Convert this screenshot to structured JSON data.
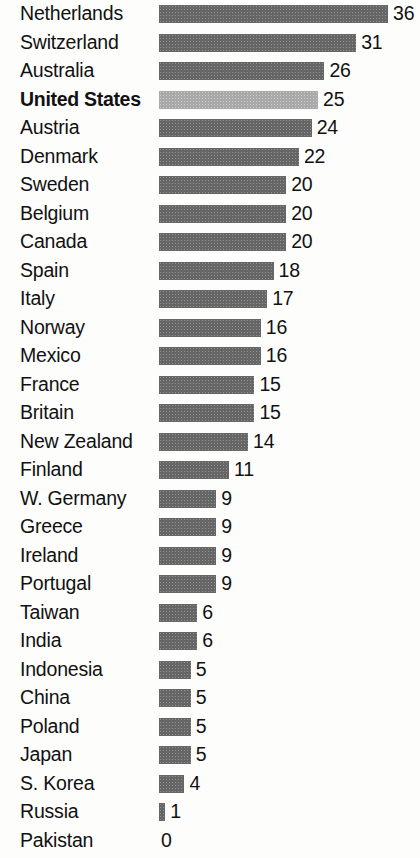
{
  "chart_data": {
    "type": "bar",
    "orientation": "horizontal",
    "title": "",
    "xlabel": "",
    "ylabel": "",
    "xlim": [
      0,
      36
    ],
    "grid": false,
    "legend": "none",
    "highlight_category": "United States",
    "colors": {
      "bar": "#666666",
      "bar_highlight": "#a9a9a9",
      "text": "#111111",
      "background": "#fdfdfc"
    },
    "categories": [
      "Netherlands",
      "Switzerland",
      "Australia",
      "United States",
      "Austria",
      "Denmark",
      "Sweden",
      "Belgium",
      "Canada",
      "Spain",
      "Italy",
      "Norway",
      "Mexico",
      "France",
      "Britain",
      "New Zealand",
      "Finland",
      "W. Germany",
      "Greece",
      "Ireland",
      "Portugal",
      "Taiwan",
      "India",
      "Indonesia",
      "China",
      "Poland",
      "Japan",
      "S. Korea",
      "Russia",
      "Pakistan"
    ],
    "values": [
      36,
      31,
      26,
      25,
      24,
      22,
      20,
      20,
      20,
      18,
      17,
      16,
      16,
      15,
      15,
      14,
      11,
      9,
      9,
      9,
      9,
      6,
      6,
      5,
      5,
      5,
      5,
      4,
      1,
      0
    ],
    "rows": [
      {
        "label": "Netherlands",
        "value": 36,
        "value_text": "36",
        "highlight": false
      },
      {
        "label": "Switzerland",
        "value": 31,
        "value_text": "31",
        "highlight": false
      },
      {
        "label": "Australia",
        "value": 26,
        "value_text": "26",
        "highlight": false
      },
      {
        "label": "United States",
        "value": 25,
        "value_text": "25",
        "highlight": true
      },
      {
        "label": "Austria",
        "value": 24,
        "value_text": "24",
        "highlight": false
      },
      {
        "label": "Denmark",
        "value": 22,
        "value_text": "22",
        "highlight": false
      },
      {
        "label": "Sweden",
        "value": 20,
        "value_text": "20",
        "highlight": false
      },
      {
        "label": "Belgium",
        "value": 20,
        "value_text": "20",
        "highlight": false
      },
      {
        "label": "Canada",
        "value": 20,
        "value_text": "20",
        "highlight": false
      },
      {
        "label": "Spain",
        "value": 18,
        "value_text": "18",
        "highlight": false
      },
      {
        "label": "Italy",
        "value": 17,
        "value_text": "17",
        "highlight": false
      },
      {
        "label": "Norway",
        "value": 16,
        "value_text": "16",
        "highlight": false
      },
      {
        "label": "Mexico",
        "value": 16,
        "value_text": "16",
        "highlight": false
      },
      {
        "label": "France",
        "value": 15,
        "value_text": "15",
        "highlight": false
      },
      {
        "label": "Britain",
        "value": 15,
        "value_text": "15",
        "highlight": false
      },
      {
        "label": "New Zealand",
        "value": 14,
        "value_text": "14",
        "highlight": false
      },
      {
        "label": "Finland",
        "value": 11,
        "value_text": "11",
        "highlight": false
      },
      {
        "label": "W. Germany",
        "value": 9,
        "value_text": "9",
        "highlight": false
      },
      {
        "label": "Greece",
        "value": 9,
        "value_text": "9",
        "highlight": false
      },
      {
        "label": "Ireland",
        "value": 9,
        "value_text": "9",
        "highlight": false
      },
      {
        "label": "Portugal",
        "value": 9,
        "value_text": "9",
        "highlight": false
      },
      {
        "label": "Taiwan",
        "value": 6,
        "value_text": "6",
        "highlight": false
      },
      {
        "label": "India",
        "value": 6,
        "value_text": "6",
        "highlight": false
      },
      {
        "label": "Indonesia",
        "value": 5,
        "value_text": "5",
        "highlight": false
      },
      {
        "label": "China",
        "value": 5,
        "value_text": "5",
        "highlight": false
      },
      {
        "label": "Poland",
        "value": 5,
        "value_text": "5",
        "highlight": false
      },
      {
        "label": "Japan",
        "value": 5,
        "value_text": "5",
        "highlight": false
      },
      {
        "label": "S. Korea",
        "value": 4,
        "value_text": "4",
        "highlight": false
      },
      {
        "label": "Russia",
        "value": 1,
        "value_text": "1",
        "highlight": false
      },
      {
        "label": "Pakistan",
        "value": 0,
        "value_text": "0",
        "highlight": false
      }
    ]
  }
}
